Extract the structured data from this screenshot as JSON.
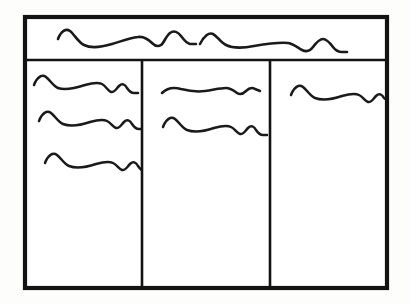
{
  "document": {
    "title": "Hand-drawn UI wireframe sketch",
    "description": "A pencil/ink wireframe showing a page frame with a header banner and three content columns filled with placeholder squiggle text lines.",
    "background_color": "#fdfdfc",
    "ink_color": "#1a1a1a",
    "frame_color": "#131313",
    "panel_color": "#ffffff"
  },
  "frame": {
    "name": "page-outline",
    "x": 25,
    "y": 17,
    "width": 362,
    "height": 271,
    "stroke_width": 4.2
  },
  "header": {
    "name": "header-banner",
    "x": 25,
    "y": 17,
    "width": 362,
    "height": 43,
    "divider_y": 60,
    "squiggle_count": 2,
    "squiggles": [
      {
        "id": "header-line-1",
        "label": "header placeholder text line 1",
        "path": "M 58 39 C 61 31 66 28 70 31 C 74 34 78 42 84 45 C 92 49 102 47 112 44 C 122 41 130 38 138 37 C 144 36 148 39 152 43 C 155 46 158 47 161 45 C 164 43 166 36 170 33 C 174 30 178 32 181 36 C 184 40 186 43 190 44 L 196 44"
      },
      {
        "id": "header-line-2",
        "label": "header placeholder text line 2",
        "path": "M 200 44 C 204 36 209 32 213 34 C 217 36 220 42 226 45 C 234 49 244 48 254 46 C 266 44 278 42 288 43 C 294 44 298 48 302 50 C 306 52 310 51 313 47 C 316 43 319 39 323 39 C 327 39 330 43 333 47 C 336 51 339 52 342 52 L 347 52"
      }
    ]
  },
  "columns": [
    {
      "id": "column-left",
      "name": "content-column-left",
      "index": 1,
      "x": 25,
      "y": 60,
      "width": 117,
      "height": 228,
      "squiggle_count": 3,
      "squiggles": [
        {
          "id": "left-line-1",
          "label": "left column placeholder text line 1",
          "path": "M 34 85 C 37 77 42 74 46 77 C 50 80 53 86 58 88 C 66 91 76 88 85 85 C 92 83 98 82 102 84 C 106 86 108 91 111 92 C 114 93 116 89 119 86 C 122 83 125 84 127 88 C 129 91 131 93 134 93 L 138 93"
        },
        {
          "id": "left-line-2",
          "label": "left column placeholder text line 2",
          "path": "M 39 121 C 42 113 47 110 51 113 C 55 116 58 122 63 124 C 71 127 81 125 90 122 C 97 120 103 119 107 121 C 111 123 113 127 116 128 C 119 129 121 125 124 122 C 127 119 130 120 132 124 C 134 127 136 129 139 129 L 143 129"
        },
        {
          "id": "left-line-3",
          "label": "left column placeholder text line 3",
          "path": "M 45 163 C 48 155 53 152 57 155 C 61 158 64 164 69 166 C 77 169 87 167 96 164 C 103 162 109 161 113 163 C 117 165 119 169 122 170 C 125 171 127 167 130 164 C 133 161 136 162 138 166 C 140 169 142 171 145 171 L 149 171"
        }
      ]
    },
    {
      "id": "column-middle",
      "name": "content-column-middle",
      "index": 2,
      "x": 142,
      "y": 60,
      "width": 128,
      "height": 228,
      "squiggle_count": 2,
      "squiggles": [
        {
          "id": "middle-line-1",
          "label": "middle column placeholder text line 1",
          "path": "M 162 93 C 167 88 174 87 181 89 C 189 91 197 92 205 91 C 213 90 220 88 226 88 C 231 88 234 91 237 93 C 240 95 243 94 246 91 C 249 88 252 87 255 89 L 260 91"
        },
        {
          "id": "middle-line-2",
          "label": "middle column placeholder text line 2",
          "path": "M 163 127 C 166 119 171 116 175 119 C 179 122 182 128 187 130 C 195 133 205 131 214 128 C 221 126 227 125 231 127 C 235 129 237 133 240 134 C 243 135 245 131 248 128 C 251 125 254 126 256 130 C 258 133 260 135 263 135 L 267 135"
        }
      ]
    },
    {
      "id": "column-right",
      "name": "content-column-right",
      "index": 3,
      "x": 270,
      "y": 60,
      "width": 117,
      "height": 228,
      "squiggle_count": 1,
      "squiggles": [
        {
          "id": "right-line-1",
          "label": "right column placeholder text line 1",
          "path": "M 291 95 C 294 87 299 84 303 87 C 307 90 310 96 315 98 C 323 101 333 99 342 96 C 349 94 355 93 359 95 C 363 97 365 101 368 102 C 371 103 373 99 376 96 C 379 93 382 94 384 98 L 387 100"
        }
      ]
    }
  ],
  "dividers": [
    {
      "id": "divider-header",
      "name": "header-divider-line",
      "orientation": "horizontal",
      "x1": 25,
      "y1": 60,
      "x2": 387,
      "y2": 60
    },
    {
      "id": "divider-col-1",
      "name": "column-divider-left",
      "orientation": "vertical",
      "x1": 142,
      "y1": 60,
      "x2": 142,
      "y2": 288
    },
    {
      "id": "divider-col-2",
      "name": "column-divider-right",
      "orientation": "vertical",
      "x1": 270,
      "y1": 60,
      "x2": 270,
      "y2": 288
    }
  ]
}
